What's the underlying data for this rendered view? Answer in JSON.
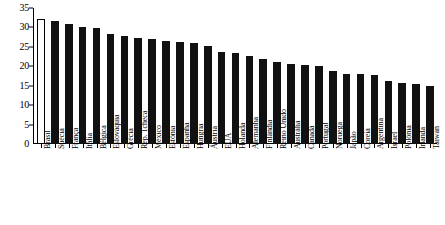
{
  "chart_data": {
    "type": "bar",
    "title": "",
    "subtitle": "",
    "xlabel": "",
    "ylabel": "",
    "ylim": [
      0,
      35
    ],
    "yticks": [
      0,
      5,
      10,
      15,
      20,
      25,
      30,
      35
    ],
    "grid": false,
    "legend": null,
    "orientation": "vertical",
    "sorted": "descending",
    "highlight_category": "Brasil",
    "highlight_style": "hollow-white-bar-with-black-outline",
    "bar_color": "#111111",
    "highlight_bar_color": "#ffffff",
    "categories": [
      "Brasil",
      "Suécia",
      "França",
      "Itália",
      "Bélgica",
      "Eslováquia",
      "Grécia",
      "Rep. Tcheca",
      "México",
      "Estônia",
      "Espanha",
      "Hungria",
      "Áustria",
      "EUA",
      "Holanda",
      "Alemanha",
      "Finlândia",
      "Reino Unido",
      "Austrália",
      "Canadá",
      "Portugal",
      "Noruega",
      "Japão",
      "Coreia",
      "Argentina",
      "Israel",
      "Polônia",
      "Irlanda",
      "Taiwan"
    ],
    "values": [
      32.3,
      31.7,
      31.0,
      30.1,
      29.9,
      28.2,
      27.7,
      27.2,
      26.9,
      26.4,
      26.2,
      25.9,
      25.3,
      23.7,
      23.3,
      22.6,
      21.9,
      21.2,
      20.7,
      20.3,
      20.1,
      18.7,
      18.1,
      18.0,
      17.8,
      16.2,
      15.8,
      15.4,
      14.9
    ]
  },
  "caption": {
    "text": ""
  }
}
